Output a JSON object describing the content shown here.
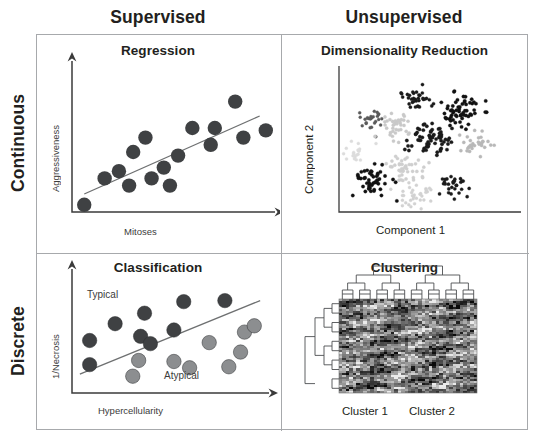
{
  "figure": {
    "background": "#ffffff",
    "frame_color": "#a7a9ac"
  },
  "columns": [
    {
      "key": "supervised",
      "label": "Supervised"
    },
    {
      "key": "unsupervised",
      "label": "Unsupervised"
    }
  ],
  "rows": [
    {
      "key": "continuous",
      "label": "Continuous"
    },
    {
      "key": "discrete",
      "label": "Discrete"
    }
  ],
  "quadrants": {
    "regression": {
      "title": "Regression",
      "xlabel": "Mitoses",
      "ylabel": "Aggressiveness"
    },
    "dimensionality_reduction": {
      "title": "Dimensionality Reduction",
      "xlabel": "Component 1",
      "ylabel": "Component 2"
    },
    "classification": {
      "title": "Classification",
      "xlabel": "Hypercellularity",
      "ylabel": "1/Necrosis",
      "annotation_above": "Typical",
      "annotation_below": "Atypical"
    },
    "clustering": {
      "title": "Clustering",
      "cluster_1_label": "Cluster 1",
      "cluster_2_label": "Cluster 2"
    }
  },
  "chart_data": [
    {
      "id": "regression",
      "type": "scatter",
      "title": "Regression",
      "xlabel": "Mitoses",
      "ylabel": "Aggressiveness",
      "xlim": [
        0,
        100
      ],
      "ylim": [
        0,
        100
      ],
      "grid": false,
      "legend": "none",
      "marker_color": "#3f4143",
      "marker_radius_px": 7.2,
      "points": [
        {
          "x": 6,
          "y": 6
        },
        {
          "x": 16,
          "y": 28
        },
        {
          "x": 23,
          "y": 34
        },
        {
          "x": 28,
          "y": 22
        },
        {
          "x": 30,
          "y": 50
        },
        {
          "x": 36,
          "y": 62
        },
        {
          "x": 39,
          "y": 28
        },
        {
          "x": 45,
          "y": 37
        },
        {
          "x": 48,
          "y": 22
        },
        {
          "x": 52,
          "y": 47
        },
        {
          "x": 59,
          "y": 70
        },
        {
          "x": 68,
          "y": 56
        },
        {
          "x": 70,
          "y": 70
        },
        {
          "x": 80,
          "y": 92
        },
        {
          "x": 84,
          "y": 62
        },
        {
          "x": 95,
          "y": 68
        }
      ],
      "trend_line": {
        "color": "#6e7071",
        "x0": 6,
        "y0": 15,
        "x1": 92,
        "y1": 80
      }
    },
    {
      "id": "dimensionality_reduction",
      "type": "scatter",
      "title": "Dimensionality Reduction",
      "xlabel": "Component 1",
      "ylabel": "Component 2",
      "grid": false,
      "legend": "none",
      "description": "Eleven point clouds of varying density and shade, ranging from near-black to pale gray, scattered across the Component 1 / Component 2 plane.",
      "clusters": [
        {
          "id": "c1",
          "cx": 46,
          "cy": 88,
          "n": 34,
          "spread": 9,
          "color": "#1a1a1a",
          "dot_r": 1.6
        },
        {
          "id": "c2",
          "cx": 72,
          "cy": 78,
          "n": 62,
          "spread": 12,
          "color": "#111111",
          "dot_r": 1.7
        },
        {
          "id": "c3",
          "cx": 20,
          "cy": 72,
          "n": 26,
          "spread": 8,
          "color": "#5a5a5a",
          "dot_r": 1.5
        },
        {
          "id": "c4",
          "cx": 34,
          "cy": 66,
          "n": 40,
          "spread": 11,
          "color": "#c9c9c9",
          "dot_r": 1.6
        },
        {
          "id": "c5",
          "cx": 54,
          "cy": 55,
          "n": 66,
          "spread": 13,
          "color": "#1a1a1a",
          "dot_r": 1.7
        },
        {
          "id": "c6",
          "cx": 82,
          "cy": 52,
          "n": 32,
          "spread": 10,
          "color": "#b8b8b8",
          "dot_r": 1.6
        },
        {
          "id": "c7",
          "cx": 10,
          "cy": 46,
          "n": 20,
          "spread": 7,
          "color": "#dcdcdc",
          "dot_r": 1.5
        },
        {
          "id": "c8",
          "cx": 40,
          "cy": 34,
          "n": 44,
          "spread": 12,
          "color": "#cfcfcf",
          "dot_r": 1.6
        },
        {
          "id": "c9",
          "cx": 20,
          "cy": 24,
          "n": 50,
          "spread": 11,
          "color": "#111111",
          "dot_r": 1.7
        },
        {
          "id": "c10",
          "cx": 70,
          "cy": 22,
          "n": 30,
          "spread": 9,
          "color": "#1a1a1a",
          "dot_r": 1.6
        },
        {
          "id": "c11",
          "cx": 44,
          "cy": 12,
          "n": 34,
          "spread": 10,
          "color": "#d2d2d2",
          "dot_r": 1.5
        }
      ]
    },
    {
      "id": "classification",
      "type": "scatter",
      "title": "Classification",
      "xlabel": "Hypercellularity",
      "ylabel": "1/Necrosis",
      "xlim": [
        0,
        100
      ],
      "ylim": [
        0,
        100
      ],
      "grid": false,
      "legend": "none",
      "annotations": [
        {
          "text": "Typical",
          "x": 18,
          "y": 90
        },
        {
          "text": "Atypical",
          "x": 62,
          "y": 12
        }
      ],
      "class_colors": {
        "typical": "#3f4143",
        "atypical": "#8c8e90"
      },
      "decision_boundary": {
        "color": "#6e7071",
        "x0": 4,
        "y0": 18,
        "x1": 96,
        "y1": 88
      },
      "series": [
        {
          "name": "Typical",
          "color": "#3f4143",
          "points": [
            {
              "x": 9,
              "y": 50
            },
            {
              "x": 9,
              "y": 27
            },
            {
              "x": 22,
              "y": 66
            },
            {
              "x": 35,
              "y": 54
            },
            {
              "x": 37,
              "y": 76
            },
            {
              "x": 40,
              "y": 47
            },
            {
              "x": 52,
              "y": 60
            },
            {
              "x": 57,
              "y": 87
            },
            {
              "x": 78,
              "y": 88
            }
          ]
        },
        {
          "name": "Atypical",
          "color": "#8c8e90",
          "points": [
            {
              "x": 31,
              "y": 16
            },
            {
              "x": 34,
              "y": 31
            },
            {
              "x": 52,
              "y": 30
            },
            {
              "x": 60,
              "y": 24
            },
            {
              "x": 70,
              "y": 48
            },
            {
              "x": 80,
              "y": 25
            },
            {
              "x": 86,
              "y": 39
            },
            {
              "x": 88,
              "y": 58
            },
            {
              "x": 93,
              "y": 64
            }
          ]
        }
      ]
    },
    {
      "id": "clustering",
      "type": "heatmap",
      "title": "Clustering",
      "grid": false,
      "legend": "none",
      "column_labels": [
        "Cluster 1",
        "Cluster 2"
      ],
      "rows": 46,
      "cols": 40,
      "colorscale": "grayscale",
      "dendrograms": [
        "top",
        "left"
      ],
      "description": "Hierarchically clustered grayscale expression heatmap with a column dendrogram on top splitting into two main column groups labelled Cluster 1 and Cluster 2, and a row dendrogram on the left."
    }
  ]
}
